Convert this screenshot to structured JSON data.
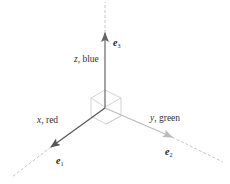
{
  "diagram": {
    "axes": [
      {
        "id": "x",
        "label_var": "x",
        "label_rest": ", red",
        "vector": "e",
        "vector_sub": "1",
        "color": "#555555"
      },
      {
        "id": "y",
        "label_var": "y",
        "label_rest": ", green",
        "vector": "e",
        "vector_sub": "2",
        "color": "#bbbbbb"
      },
      {
        "id": "z",
        "label_var": "z",
        "label_rest": ", blue",
        "vector": "e",
        "vector_sub": "3",
        "color": "#666666"
      }
    ],
    "colors": {
      "dashed": "#b5b5b5",
      "cube": "#c8c8c8",
      "text": "#333333"
    }
  }
}
